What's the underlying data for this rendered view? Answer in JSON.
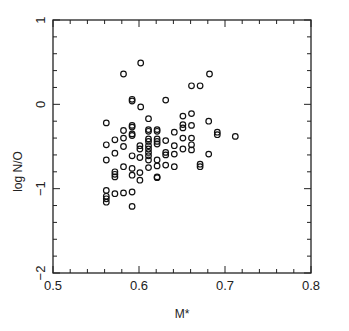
{
  "chart_data": {
    "type": "scatter",
    "title": "",
    "xlabel": "M*",
    "ylabel": "log N/O",
    "xlim": [
      0.5,
      0.8
    ],
    "ylim": [
      -2,
      1
    ],
    "xticks": [
      0.5,
      0.6,
      0.7,
      0.8
    ],
    "xtick_labels": [
      "0.5",
      "0.6",
      "0.7",
      "0.8"
    ],
    "yticks": [
      1,
      0,
      -1,
      -2
    ],
    "ytick_labels": [
      "1",
      "0",
      "−1",
      "−2"
    ],
    "x_minor_step": 0.02,
    "y_minor_step": 0.2,
    "grid": false,
    "legend": null,
    "marker": "open-circle",
    "marker_color": "#111111",
    "points": [
      [
        0.602,
        0.49
      ],
      [
        0.582,
        0.36
      ],
      [
        0.682,
        0.36
      ],
      [
        0.661,
        0.22
      ],
      [
        0.671,
        0.22
      ],
      [
        0.592,
        0.06
      ],
      [
        0.592,
        0.04
      ],
      [
        0.631,
        0.05
      ],
      [
        0.602,
        -0.03
      ],
      [
        0.611,
        -0.17
      ],
      [
        0.661,
        -0.11
      ],
      [
        0.651,
        -0.14
      ],
      [
        0.562,
        -0.22
      ],
      [
        0.681,
        -0.2
      ],
      [
        0.592,
        -0.25
      ],
      [
        0.592,
        -0.27
      ],
      [
        0.611,
        -0.3
      ],
      [
        0.611,
        -0.32
      ],
      [
        0.621,
        -0.3
      ],
      [
        0.621,
        -0.32
      ],
      [
        0.651,
        -0.24
      ],
      [
        0.651,
        -0.28
      ],
      [
        0.661,
        -0.25
      ],
      [
        0.641,
        -0.33
      ],
      [
        0.691,
        -0.33
      ],
      [
        0.691,
        -0.36
      ],
      [
        0.582,
        -0.31
      ],
      [
        0.592,
        -0.35
      ],
      [
        0.592,
        -0.37
      ],
      [
        0.712,
        -0.38
      ],
      [
        0.572,
        -0.42
      ],
      [
        0.582,
        -0.4
      ],
      [
        0.611,
        -0.41
      ],
      [
        0.611,
        -0.44
      ],
      [
        0.621,
        -0.41
      ],
      [
        0.621,
        -0.44
      ],
      [
        0.621,
        -0.47
      ],
      [
        0.631,
        -0.43
      ],
      [
        0.651,
        -0.4
      ],
      [
        0.661,
        -0.4
      ],
      [
        0.562,
        -0.48
      ],
      [
        0.582,
        -0.5
      ],
      [
        0.601,
        -0.49
      ],
      [
        0.601,
        -0.53
      ],
      [
        0.611,
        -0.49
      ],
      [
        0.611,
        -0.53
      ],
      [
        0.611,
        -0.57
      ],
      [
        0.611,
        -0.61
      ],
      [
        0.611,
        -0.66
      ],
      [
        0.641,
        -0.49
      ],
      [
        0.661,
        -0.48
      ],
      [
        0.661,
        -0.54
      ],
      [
        0.651,
        -0.53
      ],
      [
        0.631,
        -0.57
      ],
      [
        0.631,
        -0.6
      ],
      [
        0.641,
        -0.59
      ],
      [
        0.681,
        -0.59
      ],
      [
        0.572,
        -0.58
      ],
      [
        0.592,
        -0.61
      ],
      [
        0.601,
        -0.63
      ],
      [
        0.562,
        -0.66
      ],
      [
        0.621,
        -0.66
      ],
      [
        0.621,
        -0.73
      ],
      [
        0.631,
        -0.72
      ],
      [
        0.641,
        -0.74
      ],
      [
        0.611,
        -0.75
      ],
      [
        0.671,
        -0.71
      ],
      [
        0.671,
        -0.74
      ],
      [
        0.582,
        -0.74
      ],
      [
        0.592,
        -0.76
      ],
      [
        0.572,
        -0.8
      ],
      [
        0.572,
        -0.83
      ],
      [
        0.572,
        -0.86
      ],
      [
        0.592,
        -0.84
      ],
      [
        0.601,
        -0.81
      ],
      [
        0.601,
        -0.9
      ],
      [
        0.621,
        -0.86
      ],
      [
        0.621,
        -0.87
      ],
      [
        0.562,
        -1.02
      ],
      [
        0.562,
        -1.09
      ],
      [
        0.562,
        -1.12
      ],
      [
        0.562,
        -1.16
      ],
      [
        0.572,
        -1.06
      ],
      [
        0.582,
        -1.05
      ],
      [
        0.592,
        -1.04
      ],
      [
        0.592,
        -1.21
      ]
    ]
  },
  "plot_area": {
    "left": 53,
    "top": 20,
    "right": 311,
    "bottom": 273
  },
  "colors": {
    "axis": "#222222",
    "marker": "#111111",
    "background": "#ffffff"
  }
}
